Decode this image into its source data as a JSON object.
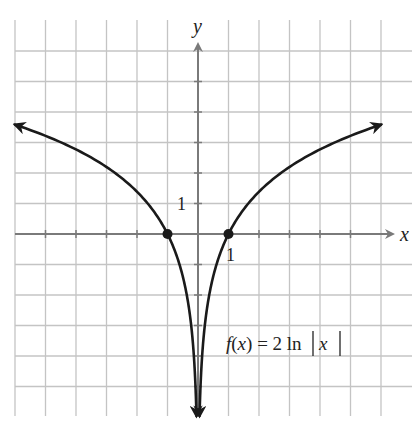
{
  "chart_data": {
    "type": "line",
    "title": "",
    "function_label": "f(x) = 2 ln|x|",
    "xlabel": "x",
    "ylabel": "y",
    "xlim": [
      -6,
      6
    ],
    "ylim": [
      -6,
      6
    ],
    "grid": true,
    "tick_labels": {
      "x": [
        "1"
      ],
      "y": [
        "1"
      ]
    },
    "series": [
      {
        "name": "f(x) = 2 ln|x|",
        "branch": "left",
        "x": [
          -6,
          -5,
          -4,
          -3,
          -2,
          -1,
          -0.5,
          -0.25,
          -0.1,
          -0.05
        ],
        "y": [
          3.58,
          3.22,
          2.77,
          2.2,
          1.39,
          0,
          -1.39,
          -2.77,
          -4.61,
          -5.99
        ]
      },
      {
        "name": "f(x) = 2 ln|x|",
        "branch": "right",
        "x": [
          0.05,
          0.1,
          0.25,
          0.5,
          1,
          2,
          3,
          4,
          5,
          6
        ],
        "y": [
          -5.99,
          -4.61,
          -2.77,
          -1.39,
          0,
          1.39,
          2.2,
          2.77,
          3.22,
          3.58
        ]
      }
    ],
    "highlighted_points": [
      {
        "x": -1,
        "y": 0
      },
      {
        "x": 1,
        "y": 0
      }
    ],
    "asymptote": {
      "type": "vertical",
      "x": 0
    }
  },
  "labels": {
    "x_axis": "x",
    "y_axis": "y",
    "x_tick_one": "1",
    "y_tick_one": "1",
    "func_f": "f",
    "func_open": "(",
    "func_x": "x",
    "func_close": ")",
    "func_eq": " = 2 ln",
    "func_bar_x": "x"
  }
}
